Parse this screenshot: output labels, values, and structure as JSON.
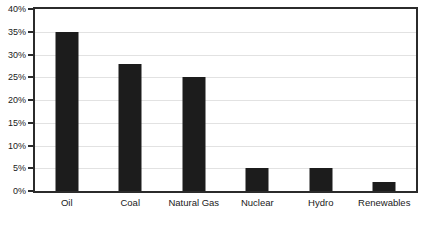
{
  "chart_data": {
    "type": "bar",
    "title": "",
    "subtitle": "",
    "xlabel": "",
    "ylabel": "",
    "categories": [
      "Oil",
      "Coal",
      "Natural Gas",
      "Nuclear",
      "Hydro",
      "Renewables"
    ],
    "values": [
      35,
      28,
      25,
      5,
      5,
      2
    ],
    "value_suffix": "%",
    "ylim": [
      0,
      40
    ],
    "ytick_step": 5,
    "ytick_labels": [
      "0%",
      "5%",
      "10%",
      "15%",
      "20%",
      "25%",
      "30%",
      "35%",
      "40%"
    ],
    "ytick_values": [
      0,
      5,
      10,
      15,
      20,
      25,
      30,
      35,
      40
    ],
    "grid": true,
    "grid_axis": "y",
    "legend": false,
    "legend_position": "none",
    "series": [
      {
        "name": "Share of energy",
        "values": [
          35,
          28,
          25,
          5,
          5,
          2
        ]
      }
    ],
    "colors": {
      "bar": "#1c1c1c",
      "frame": "#2b2b2b",
      "gridline": "#e2e2e2",
      "background": "#ffffff",
      "text": "#1a1a1a"
    }
  }
}
